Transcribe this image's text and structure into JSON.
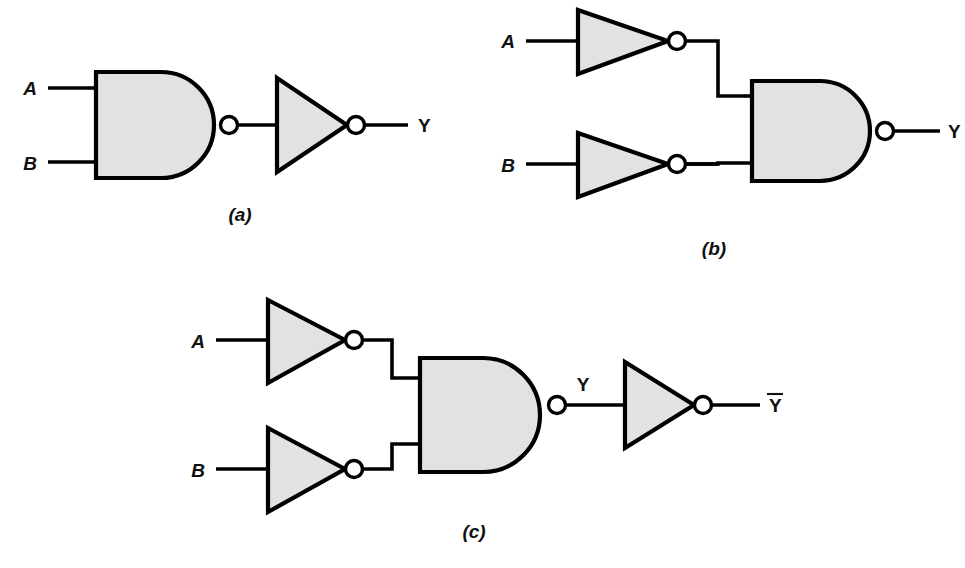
{
  "figure": {
    "background_color": "#ffffff",
    "gate_fill_color": "#e2e2e2",
    "line_color": "#000000",
    "bubble_fill_color": "#ffffff"
  },
  "circuits": [
    {
      "id": "a",
      "caption": "(a)",
      "caption_pos": {
        "x": 240,
        "y": 221
      },
      "description": "Two-input NAND gate driving an inverter",
      "inputs": [
        {
          "label": "A",
          "x": 30,
          "y": 95,
          "wire_y": 88,
          "wire_x1": 48,
          "wire_x2": 96
        },
        {
          "label": "B",
          "x": 30,
          "y": 170,
          "wire_y": 162,
          "wire_x1": 48,
          "wire_x2": 96
        }
      ],
      "nand": {
        "x": 96,
        "y": 72,
        "w": 118,
        "h": 106,
        "bubble": {
          "cx": 229,
          "cy": 125,
          "r": 8.5
        }
      },
      "inverter": {
        "x1": 277,
        "y1": 78,
        "x2": 277,
        "y2": 172,
        "tipx": 347,
        "tipy": 125,
        "bubble": {
          "cx": 356,
          "cy": 125,
          "r": 8.5
        }
      },
      "wires": [
        {
          "name": "nand-to-inverter",
          "points": "238,125 277,125"
        },
        {
          "name": "inverter-to-output",
          "points": "365,125 408,125"
        }
      ],
      "outputs": [
        {
          "label": "Y",
          "overbar": false,
          "x": 418,
          "y": 132
        }
      ]
    },
    {
      "id": "b",
      "caption": "(b)",
      "caption_pos": {
        "x": 714,
        "y": 255
      },
      "description": "Two inverters driving a two-input NAND gate",
      "inputs": [
        {
          "label": "A",
          "x": 508,
          "y": 48,
          "wire_y": 41,
          "wire_x1": 526,
          "wire_x2": 578
        },
        {
          "label": "B",
          "x": 508,
          "y": 172,
          "wire_y": 164,
          "wire_x1": 526,
          "wire_x2": 578
        }
      ],
      "inverters": [
        {
          "name": "inverter-a",
          "x1": 578,
          "y1": 10,
          "x2": 578,
          "y2": 74,
          "tipx": 668,
          "tipy": 41,
          "bubble": {
            "cx": 677,
            "cy": 41,
            "r": 8.5
          }
        },
        {
          "name": "inverter-b",
          "x1": 578,
          "y1": 133,
          "x2": 578,
          "y2": 197,
          "tipx": 668,
          "tipy": 164,
          "bubble": {
            "cx": 677,
            "cy": 164,
            "r": 8.5
          }
        }
      ],
      "nand": {
        "x": 752,
        "y": 81,
        "w": 118,
        "h": 100,
        "bubble": {
          "cx": 885,
          "cy": 131,
          "r": 8.5
        }
      },
      "wires": [
        {
          "name": "inverter-a-step",
          "points": "686,41 718,41 718,96 752,96"
        },
        {
          "name": "inverter-b-step",
          "points": "686,164 718,164 718,164 718,164"
        },
        {
          "name": "inverter-b-step2",
          "points": "686,164 718,164 718,163 752,163"
        },
        {
          "name": "nand-to-output",
          "points": "894,131 940,131"
        }
      ],
      "outputs": [
        {
          "label": "Y",
          "overbar": false,
          "x": 948,
          "y": 138
        }
      ]
    },
    {
      "id": "c",
      "caption": "(c)",
      "caption_pos": {
        "x": 474,
        "y": 538
      },
      "description": "Two inverters driving a NAND gate whose output Y feeds a final inverter producing Y-bar",
      "inputs": [
        {
          "label": "A",
          "x": 198,
          "y": 348,
          "wire_y": 340,
          "wire_x1": 216,
          "wire_x2": 268
        },
        {
          "label": "B",
          "x": 198,
          "y": 477,
          "wire_y": 469,
          "wire_x1": 216,
          "wire_x2": 268
        }
      ],
      "inverters": [
        {
          "name": "inverter-a",
          "x1": 268,
          "y1": 300,
          "x2": 268,
          "y2": 383,
          "tipx": 345,
          "tipy": 340,
          "bubble": {
            "cx": 354,
            "cy": 340,
            "r": 8.5
          }
        },
        {
          "name": "inverter-b",
          "x1": 268,
          "y1": 428,
          "x2": 268,
          "y2": 512,
          "tipx": 345,
          "tipy": 469,
          "bubble": {
            "cx": 354,
            "cy": 469,
            "r": 8.5
          }
        }
      ],
      "nand": {
        "x": 420,
        "y": 358,
        "w": 120,
        "h": 114,
        "bubble": {
          "cx": 557,
          "cy": 405,
          "r": 8.5
        }
      },
      "final_inverter": {
        "name": "output-inverter",
        "x1": 625,
        "y1": 362,
        "x2": 625,
        "y2": 448,
        "tipx": 694,
        "tipy": 405,
        "bubble": {
          "cx": 703,
          "cy": 405,
          "r": 8.5
        }
      },
      "wires": [
        {
          "name": "inverter-a-step",
          "points": "363,340 392,340 392,378 420,378"
        },
        {
          "name": "inverter-b-step",
          "points": "363,469 392,469 392,444 420,444"
        },
        {
          "name": "nand-to-inverter",
          "points": "566,405 625,405"
        },
        {
          "name": "inverter-to-output",
          "points": "712,405 760,405"
        }
      ],
      "intermediate_labels": [
        {
          "label": "Y",
          "x": 583,
          "y": 391
        }
      ],
      "outputs": [
        {
          "label": "Y",
          "overbar": true,
          "x": 769,
          "y": 412,
          "bar_x1": 767,
          "bar_x2": 783,
          "bar_y": 394
        }
      ]
    }
  ]
}
